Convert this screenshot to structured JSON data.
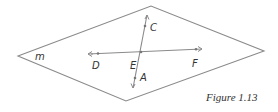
{
  "figure": {
    "caption": "Figure 1.13",
    "plane_label": "m",
    "points": {
      "A": "A",
      "C": "C",
      "D": "D",
      "E": "E",
      "F": "F"
    }
  },
  "colors": {
    "line": "#8a8a8a",
    "text": "#333333"
  }
}
